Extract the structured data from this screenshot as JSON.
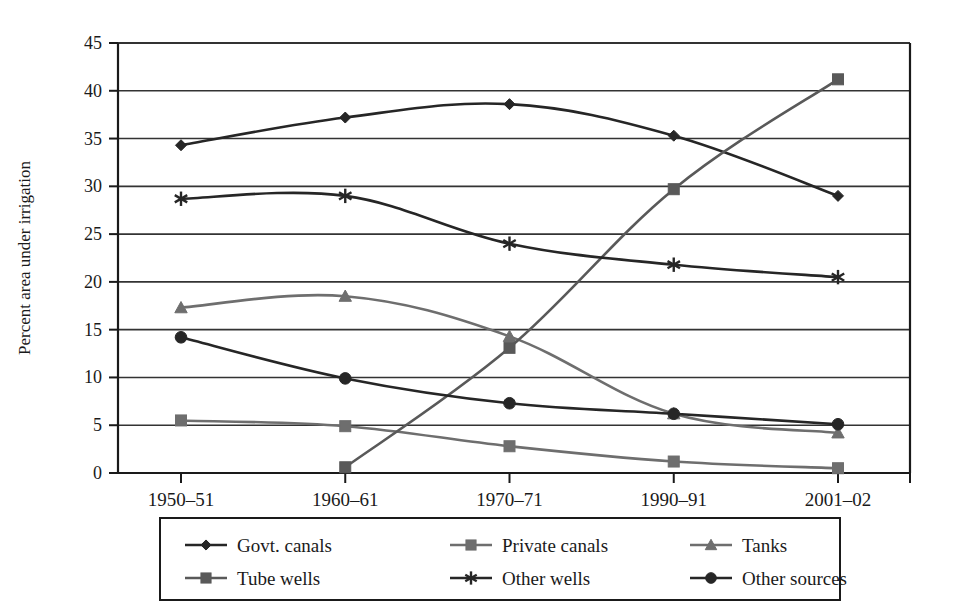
{
  "chart_data": {
    "type": "line",
    "title": "",
    "xlabel": "",
    "ylabel": "Percent area under irrigation",
    "categories": [
      "1950–51",
      "1960–61",
      "1970–71",
      "1990–91",
      "2001–02"
    ],
    "ylim": [
      0,
      45
    ],
    "ytick_step": 5,
    "yticks": [
      "0",
      "5",
      "10",
      "15",
      "20",
      "25",
      "30",
      "35",
      "40",
      "45"
    ],
    "grid": "horizontal",
    "legend_position": "bottom",
    "series": [
      {
        "name": "Govt. canals",
        "marker": "diamond",
        "color": "#262626",
        "values": [
          34.3,
          37.2,
          38.6,
          35.3,
          29.0
        ]
      },
      {
        "name": "Private canals",
        "marker": "square",
        "color": "#6e6e6e",
        "values": [
          5.5,
          4.9,
          2.8,
          1.2,
          0.5
        ]
      },
      {
        "name": "Tanks",
        "marker": "triangle",
        "color": "#6e6e6e",
        "values": [
          17.3,
          18.5,
          14.3,
          6.2,
          4.2
        ]
      },
      {
        "name": "Tube wells",
        "marker": "square",
        "color": "#595959",
        "values": [
          0.0,
          0.6,
          13.1,
          29.7,
          41.2
        ]
      },
      {
        "name": "Other wells",
        "marker": "asterisk",
        "color": "#262626",
        "values": [
          28.7,
          29.0,
          24.0,
          21.8,
          20.5
        ]
      },
      {
        "name": "Other sources",
        "marker": "circle",
        "color": "#262626",
        "values": [
          14.2,
          9.9,
          7.3,
          6.2,
          5.1
        ]
      }
    ],
    "series_notes": {
      "tube_wells_first_point_hidden": true
    }
  },
  "legend": {
    "rows": [
      [
        "Govt. canals",
        "Private canals",
        "Tanks"
      ],
      [
        "Tube wells",
        "Other wells",
        "Other sources"
      ]
    ]
  },
  "colors": {
    "axis": "#1a1a1a",
    "grid": "#333333",
    "background": "#ffffff",
    "dark_series": "#262626",
    "gray_series": "#6e6e6e"
  }
}
